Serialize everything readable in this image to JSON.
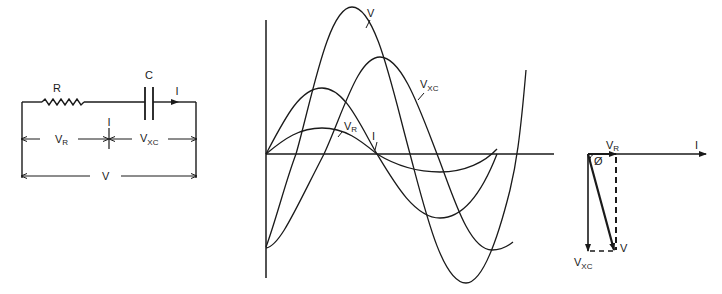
{
  "circuit": {
    "resistor_label": "R",
    "capacitor_label": "C",
    "current_label": "I",
    "vr_label": "V",
    "vr_sub": "R",
    "vxc_label": "V",
    "vxc_sub": "XC",
    "v_total_label": "V"
  },
  "waveforms": {
    "v_label": "V",
    "vxc_label": "V",
    "vxc_sub": "XC",
    "vr_label": "V",
    "vr_sub": "R",
    "i_label": "I"
  },
  "phasor": {
    "vr_label": "V",
    "vr_sub": "R",
    "i_label": "I",
    "phi_label": "Ø",
    "v_label": "V",
    "vxc_label": "V",
    "vxc_sub": "XC"
  },
  "colors": {
    "ink": "#1a1a1a",
    "background": "#ffffff"
  }
}
